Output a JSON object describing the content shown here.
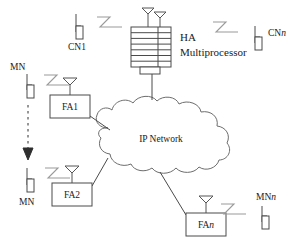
{
  "figure": {
    "type": "network-architecture-diagram",
    "background_color": "#ffffff",
    "line_color": "#4a4a4a",
    "signal_color": "#9a9a9a",
    "text_color": "#1a1a1a"
  },
  "nodes": {
    "ha": {
      "label_line1": "HA",
      "label_line2": "Multiprocessor",
      "icon": "multiprocessor-stack",
      "layers": 7,
      "antennas": 2
    },
    "cloud": {
      "label": "IP Network",
      "icon": "cloud"
    },
    "foreign_agents": [
      {
        "id": "fa1",
        "label": "FA1",
        "italic_suffix": ""
      },
      {
        "id": "fa2",
        "label": "FA2",
        "italic_suffix": ""
      },
      {
        "id": "fan",
        "label": "FA",
        "italic_suffix": "n"
      }
    ],
    "correspondent_nodes": [
      {
        "id": "cn1",
        "label": "CN1",
        "italic_suffix": "",
        "label_position": "below"
      },
      {
        "id": "cnn",
        "label": "CN",
        "italic_suffix": "n",
        "label_position": "right"
      }
    ],
    "mobile_nodes": [
      {
        "id": "mn-top",
        "label": "MN",
        "italic_suffix": "",
        "label_position": "above"
      },
      {
        "id": "mn-bottom",
        "label": "MN",
        "italic_suffix": "",
        "label_position": "below"
      },
      {
        "id": "mn-n",
        "label": "MN",
        "italic_suffix": "n",
        "label_position": "right"
      }
    ]
  },
  "annotations": {
    "handoff_arrow": {
      "style": "dashed",
      "direction": "down",
      "meaning": "mobile-node-movement"
    }
  }
}
